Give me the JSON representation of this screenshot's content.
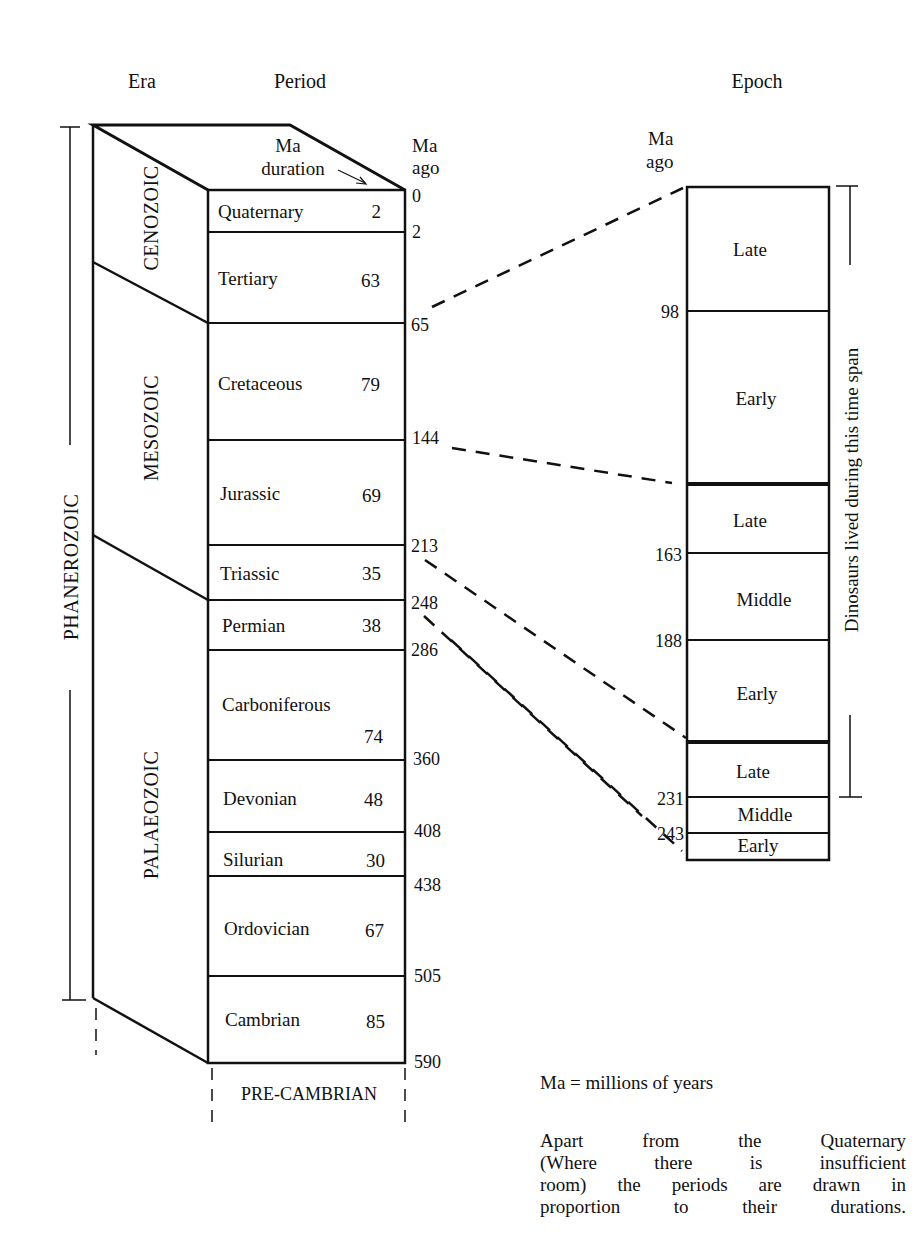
{
  "headers": {
    "era": "Era",
    "period": "Period",
    "epoch": "Epoch",
    "ma_duration_line1": "Ma",
    "ma_duration_line2": "duration",
    "ma_ago_line1": "Ma",
    "ma_ago_line2": "ago",
    "epoch_ma_ago_line1": "Ma",
    "epoch_ma_ago_line2": "ago"
  },
  "eons": [
    {
      "name": "PHANEROZOIC",
      "from_ma": 0,
      "to_ma": 590
    }
  ],
  "eras": [
    {
      "name": "CENOZOIC",
      "from_ma": 0,
      "to_ma": 65
    },
    {
      "name": "MESOZOIC",
      "from_ma": 65,
      "to_ma": 248
    },
    {
      "name": "PALAEOZOIC",
      "from_ma": 248,
      "to_ma": 590
    }
  ],
  "periods": [
    {
      "name": "Quaternary",
      "duration": "2",
      "start_ma": "0",
      "end_ma": "2"
    },
    {
      "name": "Tertiary",
      "duration": "63",
      "start_ma": "2",
      "end_ma": "65"
    },
    {
      "name": "Cretaceous",
      "duration": "79",
      "start_ma": "65",
      "end_ma": "144"
    },
    {
      "name": "Jurassic",
      "duration": "69",
      "start_ma": "144",
      "end_ma": "213"
    },
    {
      "name": "Triassic",
      "duration": "35",
      "start_ma": "213",
      "end_ma": "248"
    },
    {
      "name": "Permian",
      "duration": "38",
      "start_ma": "248",
      "end_ma": "286"
    },
    {
      "name": "Carboniferous",
      "duration": "74",
      "start_ma": "286",
      "end_ma": "360"
    },
    {
      "name": "Devonian",
      "duration": "48",
      "start_ma": "360",
      "end_ma": "408"
    },
    {
      "name": "Silurian",
      "duration": "30",
      "start_ma": "408",
      "end_ma": "438"
    },
    {
      "name": "Ordovician",
      "duration": "67",
      "start_ma": "438",
      "end_ma": "505"
    },
    {
      "name": "Cambrian",
      "duration": "85",
      "start_ma": "505",
      "end_ma": "590"
    }
  ],
  "below_box": "PRE-CAMBRIAN",
  "period_ticks": [
    "0",
    "2",
    "65",
    "144",
    "213",
    "248",
    "286",
    "360",
    "408",
    "438",
    "505",
    "590"
  ],
  "epochs": [
    {
      "period": "Cretaceous",
      "name": "Late",
      "from_ma": 65,
      "to_ma": 98
    },
    {
      "period": "Cretaceous",
      "name": "Early",
      "from_ma": 98,
      "to_ma": 144
    },
    {
      "period": "Jurassic",
      "name": "Late",
      "from_ma": 144,
      "to_ma": 163
    },
    {
      "period": "Jurassic",
      "name": "Middle",
      "from_ma": 163,
      "to_ma": 188
    },
    {
      "period": "Jurassic",
      "name": "Early",
      "from_ma": 188,
      "to_ma": 213
    },
    {
      "period": "Triassic",
      "name": "Late",
      "from_ma": 213,
      "to_ma": 231
    },
    {
      "period": "Triassic",
      "name": "Middle",
      "from_ma": 231,
      "to_ma": 243
    },
    {
      "period": "Triassic",
      "name": "Early",
      "from_ma": 243,
      "to_ma": 248
    }
  ],
  "epoch_ticks": [
    "98",
    "163",
    "188",
    "231",
    "243"
  ],
  "dinosaur_span_label": "Dinosaurs lived during this time span",
  "notes": {
    "ma_definition": "Ma = millions of years",
    "proportion_note_lines": [
      "Apart from the Quaternary",
      "(Where there is insufficient",
      "room) the periods are drawn in",
      "proportion to their durations."
    ]
  },
  "colors": {
    "ink": "#111111",
    "background": "#ffffff"
  }
}
